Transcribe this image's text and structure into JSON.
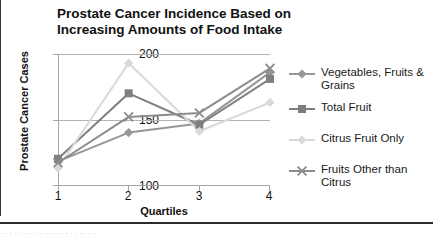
{
  "chart_data": {
    "type": "line",
    "title": "Prostate Cancer Incidence Based on Increasing Amounts of Food Intake",
    "title_line1": "Prostate Cancer Incidence Based on",
    "title_line2": "Increasing Amounts of Food Intake",
    "xlabel": "Quartiles",
    "ylabel": "Prostate Cancer Cases",
    "categories": [
      "1",
      "2",
      "3",
      "4"
    ],
    "x": [
      1,
      2,
      3,
      4
    ],
    "ylim": [
      100,
      200
    ],
    "yticks": [
      100,
      150,
      200
    ],
    "grid": true,
    "legend_position": "right",
    "series": [
      {
        "name": "Vegetables, Fruits & Grains",
        "name_line1": "Vegetables, Fruits &",
        "name_line2": "Grains",
        "marker": "diamond",
        "color": "#969696",
        "values": [
          118,
          140,
          147,
          186
        ]
      },
      {
        "name": "Total Fruit",
        "name_line1": "Total Fruit",
        "name_line2": "",
        "marker": "square",
        "color": "#7f7f7f",
        "values": [
          120,
          170,
          146,
          181
        ]
      },
      {
        "name": "Citrus Fruit Only",
        "name_line1": "Citrus Fruit Only",
        "name_line2": "",
        "marker": "diamond",
        "color": "#d9d9d9",
        "values": [
          113,
          193,
          141,
          163
        ]
      },
      {
        "name": "Fruits Other than Citrus",
        "name_line1": "Fruits Other than",
        "name_line2": "Citrus",
        "marker": "x",
        "color": "#8c8c8c",
        "values": [
          117,
          152,
          155,
          189
        ]
      }
    ]
  },
  "footer": {
    "tail_fragment": ". .  .    .   .    .     .  .      ..  .. ..   .    .    .   .    ..   .   .."
  }
}
